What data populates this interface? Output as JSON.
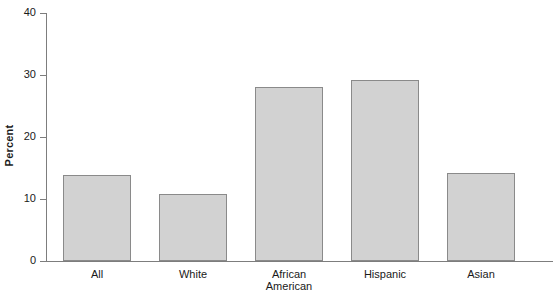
{
  "chart_data": {
    "type": "bar",
    "title": "",
    "subtitle": "",
    "xlabel": "",
    "ylabel": "Percent",
    "categories": [
      "All",
      "White",
      "African\nAmerican",
      "Hispanic",
      "Asian"
    ],
    "values": [
      13.8,
      10.8,
      28.1,
      29.2,
      14.2
    ],
    "ylim": [
      0,
      40
    ],
    "yticks": [
      0,
      10,
      20,
      30,
      40
    ],
    "ytick_labels": [
      "0",
      "10",
      "20",
      "30",
      "40"
    ],
    "grid": false,
    "legend": null,
    "bar_fill_color": "#d2d2d2",
    "bar_edge_color": "#8a8a8a",
    "axis_color": "#7d7d7d",
    "background_color": "#ffffff"
  }
}
